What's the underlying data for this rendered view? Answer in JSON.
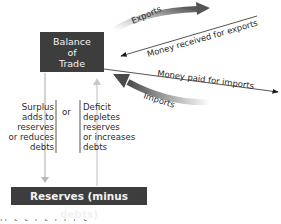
{
  "diagram": {
    "nodes": {
      "balance_of_trade": "Balance\nof\nTrade",
      "balance_lines": [
        "Balance",
        "of",
        "Trade"
      ],
      "reserves": "Reserves (minus debts)"
    },
    "flows": {
      "exports": "Exports",
      "money_received": "Money received for exports",
      "money_paid": "Money paid for imports",
      "imports": "Imports"
    },
    "surplus": {
      "lines": [
        "Surplus",
        "adds to",
        "reserves",
        "or reduces",
        "debts"
      ]
    },
    "connector": "or",
    "deficit": {
      "lines": [
        "Deficit",
        "depletes",
        "reserves",
        "or increases",
        "debts"
      ]
    },
    "colors": {
      "box_fill": "#3d3d3d",
      "box_text": "#f2f2f2",
      "arrow_dark": "#4a4a4a",
      "arrow_light": "#c8c8c8",
      "line": "#2a2a2a"
    }
  }
}
